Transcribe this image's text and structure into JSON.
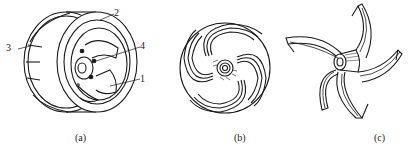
{
  "figure": {
    "panels": [
      {
        "id": "a",
        "caption": "(a)",
        "callouts": [
          {
            "number": "1",
            "position": "right-lower"
          },
          {
            "number": "2",
            "position": "top"
          },
          {
            "number": "3",
            "position": "left"
          },
          {
            "number": "4",
            "position": "right-upper"
          }
        ]
      },
      {
        "id": "b",
        "caption": "(b)"
      },
      {
        "id": "c",
        "caption": "(c)"
      }
    ],
    "colors": {
      "line": "#1a1a1a",
      "background": "#ffffff"
    }
  }
}
